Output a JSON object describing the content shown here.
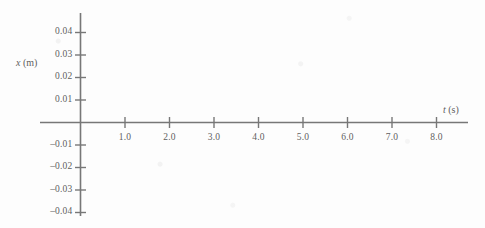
{
  "figure": {
    "kind": "blank-coordinate-axes",
    "background_color": "#fdfdfd",
    "line_color": "#777777",
    "text_color": "#5f5f5f"
  },
  "axes": {
    "x_axis": {
      "variable": "t",
      "unit": "(s)",
      "label": "t (s)",
      "label_position": "right-end"
    },
    "y_axis": {
      "variable": "x",
      "unit": "(m)",
      "label": "x (m)",
      "label_position": "upper-left"
    }
  },
  "chart_data": {
    "type": "line",
    "title": "",
    "subtitle": "",
    "xlabel": "t (s)",
    "ylabel": "x (m)",
    "xlim": [
      0,
      8.8
    ],
    "ylim": [
      -0.045,
      0.045
    ],
    "grid": false,
    "legend": null,
    "annotations": [],
    "series": [],
    "x": [],
    "values": [],
    "note": "Empty axes template: no data curve or points are plotted.",
    "x_ticks": [
      {
        "value": 1.0,
        "label": "1.0"
      },
      {
        "value": 2.0,
        "label": "2.0"
      },
      {
        "value": 3.0,
        "label": "3.0"
      },
      {
        "value": 4.0,
        "label": "4.0"
      },
      {
        "value": 5.0,
        "label": "5.0"
      },
      {
        "value": 6.0,
        "label": "6.0"
      },
      {
        "value": 7.0,
        "label": "7.0"
      },
      {
        "value": 8.0,
        "label": "8.0"
      }
    ],
    "y_ticks": [
      {
        "value": 0.04,
        "label": "0.04"
      },
      {
        "value": 0.03,
        "label": "0.03"
      },
      {
        "value": 0.02,
        "label": "0.02"
      },
      {
        "value": 0.01,
        "label": "0.01"
      },
      {
        "value": -0.01,
        "label": "–0.01"
      },
      {
        "value": -0.02,
        "label": "–0.02"
      },
      {
        "value": -0.03,
        "label": "–0.03"
      },
      {
        "value": -0.04,
        "label": "–0.04"
      }
    ]
  }
}
